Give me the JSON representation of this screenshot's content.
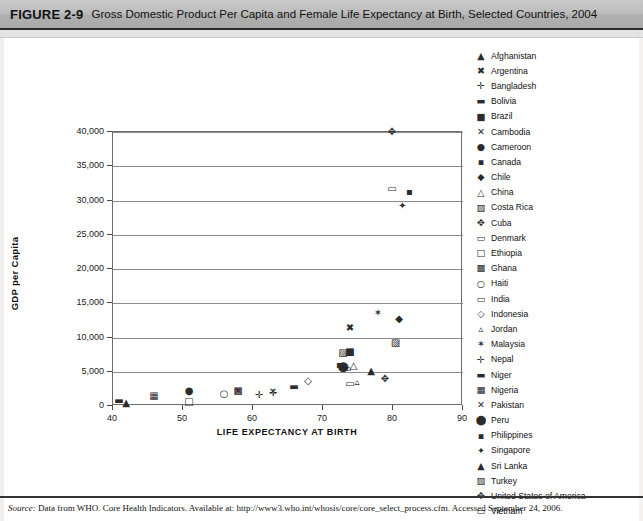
{
  "figure": {
    "number": "FIGURE 2-9",
    "title": "Gross Domestic Product Per Capita and Female Life Expectancy at Birth, Selected Countries, 2004"
  },
  "source_note": {
    "label": "Source:",
    "text": " Data from WHO. Core Health Indicators. Available at: http://www3.who.int/whosis/core/core_select_process.cfm. Accessed September 24, 2006."
  },
  "chart_data": {
    "type": "scatter",
    "title": "Gross Domestic Product Per Capita and Female Life Expectancy at Birth, Selected Countries, 2004",
    "xlabel": "LIFE EXPECTANCY AT BIRTH",
    "ylabel": "GDP per Capita",
    "xlim": [
      40,
      90
    ],
    "ylim": [
      0,
      40000
    ],
    "xticks": [
      40,
      50,
      60,
      70,
      80,
      90
    ],
    "xtick_labels": [
      "40",
      "50",
      "60",
      "70",
      "80",
      "90"
    ],
    "yticks": [
      0,
      5000,
      10000,
      15000,
      20000,
      25000,
      30000,
      35000,
      40000
    ],
    "ytick_labels": [
      "0",
      "5,000",
      "10,000",
      "15,000",
      "20,000",
      "25,000",
      "30,000",
      "35,000",
      "40,000"
    ],
    "grid": "horizontal",
    "legend_position": "right",
    "series": [
      {
        "name": "Afghanistan",
        "marker": "▲",
        "x": 42.0,
        "y": 300
      },
      {
        "name": "Argentina",
        "marker": "✖",
        "x": 74.0,
        "y": 11300
      },
      {
        "name": "Bangladesh",
        "marker": "✛",
        "x": 61.0,
        "y": 1500
      },
      {
        "name": "Bolivia",
        "marker": "▬",
        "x": 66.0,
        "y": 2700
      },
      {
        "name": "Brazil",
        "marker": "■",
        "x": 74.0,
        "y": 7700
      },
      {
        "name": "Cambodia",
        "marker": "✕",
        "x": 58.0,
        "y": 2000
      },
      {
        "name": "Cameroon",
        "marker": "●",
        "x": 51.0,
        "y": 2000
      },
      {
        "name": "Canada",
        "marker": "▪",
        "x": 82.5,
        "y": 31100
      },
      {
        "name": "Chile",
        "marker": "◆",
        "x": 81.0,
        "y": 12600
      },
      {
        "name": "China",
        "marker": "△",
        "x": 74.5,
        "y": 5700
      },
      {
        "name": "Costa Rica",
        "marker": "▨",
        "x": 73.0,
        "y": 7600
      },
      {
        "name": "Cuba",
        "marker": "✥",
        "x": 79.0,
        "y": 3800
      },
      {
        "name": "Denmark",
        "marker": "▭",
        "x": 80.0,
        "y": 31500
      },
      {
        "name": "Ethiopia",
        "marker": "□",
        "x": 51.0,
        "y": 500
      },
      {
        "name": "Ghana",
        "marker": "▩",
        "x": 58.0,
        "y": 2100
      },
      {
        "name": "Haiti",
        "marker": "○",
        "x": 56.0,
        "y": 1600
      },
      {
        "name": "India",
        "marker": "▭",
        "x": 74.0,
        "y": 3100
      },
      {
        "name": "Indonesia",
        "marker": "◇",
        "x": 68.0,
        "y": 3500
      },
      {
        "name": "Jordan",
        "marker": "▵",
        "x": 75.0,
        "y": 3400
      },
      {
        "name": "Malaysia",
        "marker": "✶",
        "x": 78.0,
        "y": 13500
      },
      {
        "name": "Nepal",
        "marker": "✛",
        "x": 63.0,
        "y": 1800
      },
      {
        "name": "Niger",
        "marker": "▬",
        "x": 41.0,
        "y": 600
      },
      {
        "name": "Nigeria",
        "marker": "▦",
        "x": 46.0,
        "y": 1300
      },
      {
        "name": "Pakistan",
        "marker": "✕",
        "x": 63.0,
        "y": 1900
      },
      {
        "name": "Peru",
        "marker": "⬤",
        "x": 73.0,
        "y": 5500
      },
      {
        "name": "Philippines",
        "marker": "▪",
        "x": 72.5,
        "y": 5800
      },
      {
        "name": "Singapore",
        "marker": "✦",
        "x": 81.5,
        "y": 29000
      },
      {
        "name": "Sri Lanka",
        "marker": "▲",
        "x": 77.0,
        "y": 5000
      },
      {
        "name": "Turkey",
        "marker": "▨",
        "x": 80.5,
        "y": 9000
      },
      {
        "name": "United States of America",
        "marker": "✥",
        "x": 80.0,
        "y": 39900
      },
      {
        "name": "Vietnam",
        "marker": "▭",
        "x": 73.5,
        "y": 5200
      }
    ]
  },
  "legend": {
    "items": [
      {
        "marker": "▲",
        "label": "Afghanistan"
      },
      {
        "marker": "✖",
        "label": "Argentina"
      },
      {
        "marker": "✛",
        "label": "Bangladesh"
      },
      {
        "marker": "▬",
        "label": "Bolivia"
      },
      {
        "marker": "■",
        "label": "Brazil"
      },
      {
        "marker": "✕",
        "label": "Cambodia"
      },
      {
        "marker": "●",
        "label": "Cameroon"
      },
      {
        "marker": "▪",
        "label": "Canada"
      },
      {
        "marker": "◆",
        "label": "Chile"
      },
      {
        "marker": "△",
        "label": "China"
      },
      {
        "marker": "▨",
        "label": "Costa Rica"
      },
      {
        "marker": "✥",
        "label": "Cuba"
      },
      {
        "marker": "▭",
        "label": "Denmark"
      },
      {
        "marker": "□",
        "label": "Ethiopia"
      },
      {
        "marker": "▩",
        "label": "Ghana"
      },
      {
        "marker": "○",
        "label": "Haiti"
      },
      {
        "marker": "▭",
        "label": "India"
      },
      {
        "marker": "◇",
        "label": "Indonesia"
      },
      {
        "marker": "▵",
        "label": "Jordan"
      },
      {
        "marker": "✶",
        "label": "Malaysia"
      },
      {
        "marker": "✛",
        "label": "Nepal"
      },
      {
        "marker": "▬",
        "label": "Niger"
      },
      {
        "marker": "▦",
        "label": "Nigeria"
      },
      {
        "marker": "✕",
        "label": "Pakistan"
      },
      {
        "marker": "⬤",
        "label": "Peru"
      },
      {
        "marker": "▪",
        "label": "Philippines"
      },
      {
        "marker": "✦",
        "label": "Singapore"
      },
      {
        "marker": "▲",
        "label": "Sri Lanka"
      },
      {
        "marker": "▨",
        "label": "Turkey"
      },
      {
        "marker": "✥",
        "label": "United States of America"
      },
      {
        "marker": "▭",
        "label": "Vietnam"
      }
    ]
  }
}
